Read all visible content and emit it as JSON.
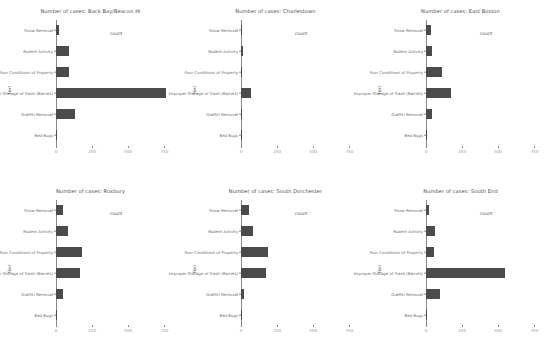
{
  "figure": {
    "axis_titles": {
      "x": "count",
      "y": "Text"
    },
    "xticks": [
      0,
      250,
      500,
      750
    ],
    "xtick_labels": [
      "0",
      "250",
      "500",
      "750"
    ],
    "bar_color": "#4b4b4b",
    "axis_color": "#8a8a8a"
  },
  "chart_data": {
    "type": "bar",
    "orientation": "horizontal",
    "xlabel": "count",
    "ylabel": "Text",
    "xlim": [
      0,
      830
    ],
    "grid": false,
    "legend": "none",
    "categories": [
      "Snow Removal",
      "Rodent Activity",
      "Poor Conditions of Property",
      "Improper Storage of Trash (Barrels)",
      "Graffiti Removal",
      "Bed Bugs"
    ],
    "panels": [
      {
        "title": "Number of cases: Back Bay/Beacon Hi",
        "neighborhood": "Back Bay/Beacon Hi",
        "values": [
          18,
          92,
          88,
          760,
          130,
          3
        ]
      },
      {
        "title": "Number of cases: Charlestown",
        "neighborhood": "Charlestown",
        "values": [
          10,
          14,
          9,
          68,
          10,
          2
        ]
      },
      {
        "title": "Number of cases: East Boston",
        "neighborhood": "East Boston",
        "values": [
          36,
          42,
          108,
          175,
          40,
          2
        ]
      },
      {
        "title": "Number of cases: Roxbury",
        "neighborhood": "Roxbury",
        "values": [
          50,
          85,
          180,
          165,
          45,
          6
        ]
      },
      {
        "title": "Number of cases: South Dorchester",
        "neighborhood": "South Dorchester",
        "values": [
          55,
          82,
          190,
          170,
          22,
          3
        ]
      },
      {
        "title": "Number of cases: South End",
        "neighborhood": "South End",
        "values": [
          22,
          60,
          55,
          545,
          95,
          3
        ]
      }
    ]
  }
}
